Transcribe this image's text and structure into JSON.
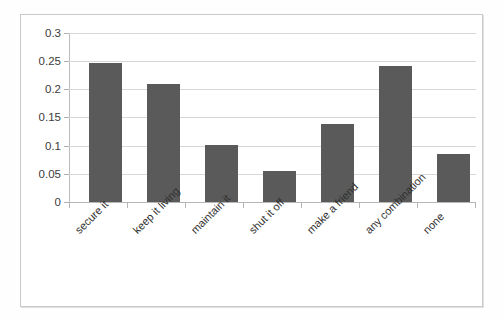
{
  "chart_data": {
    "type": "bar",
    "title": "",
    "subtitle": "",
    "xlabel": "",
    "ylabel": "",
    "categories": [
      "secure it",
      "keep it living",
      "maintain it",
      "shut it off",
      "make a friend",
      "any combination",
      "none"
    ],
    "values": [
      0.247,
      0.209,
      0.101,
      0.055,
      0.138,
      0.241,
      0.086
    ],
    "series": [
      {
        "name": "",
        "values": [
          0.247,
          0.209,
          0.101,
          0.055,
          0.138,
          0.241,
          0.086
        ]
      }
    ],
    "ylim": [
      0,
      0.3
    ],
    "ytick_labels": [
      "0",
      "0.05",
      "0.1",
      "0.15",
      "0.2",
      "0.25",
      "0.3"
    ],
    "ytick_values": [
      0,
      0.05,
      0.1,
      0.15,
      0.2,
      0.25,
      0.3
    ],
    "grid": true,
    "legend": false,
    "legend_position": "none",
    "bar_color": "#5a5a5a",
    "gridline_color": "#d8d8d8",
    "axis_color": "#b6b6b6",
    "plot_background": "#ffffff",
    "label_rotation": "-45"
  }
}
